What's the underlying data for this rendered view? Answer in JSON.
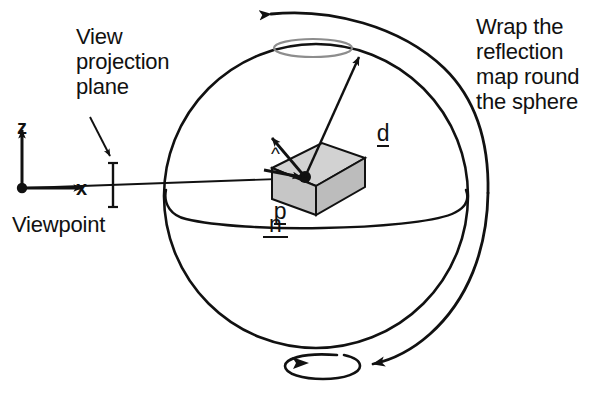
{
  "figure": {
    "background": "#ffffff",
    "stroke_color": "#111111",
    "box_face_fill": "#c8c8c8",
    "box_top_fill": "#d4d4d4",
    "box_side_fill": "#bdbdbd"
  },
  "labels": {
    "view_projection_plane": "View\nprojection\nplane",
    "viewpoint": "Viewpoint",
    "wrap_note": "Wrap the\nreflection\nmap round\nthe sphere",
    "axis_x": "x",
    "axis_z": "z",
    "normal_hat": "^",
    "normal_symbol": "n",
    "direction_symbol": "d",
    "position_symbol": "p"
  },
  "geometry": {
    "sphere": {
      "cx": 316,
      "cy": 196,
      "r": 152
    },
    "viewpoint": {
      "x": 22,
      "y": 188
    },
    "surface_point": {
      "x": 305,
      "y": 177
    },
    "projection_plane_x": 113,
    "top_cap_ellipse": {
      "cx": 313,
      "cy": 48,
      "rx": 39,
      "ry": 9
    },
    "bottom_cap_ellipse": {
      "cx": 322,
      "cy": 365,
      "rx": 38,
      "ry": 11
    },
    "equator_ellipse": {
      "cx": 316,
      "cy": 196,
      "rx": 152,
      "ry": 24
    }
  }
}
